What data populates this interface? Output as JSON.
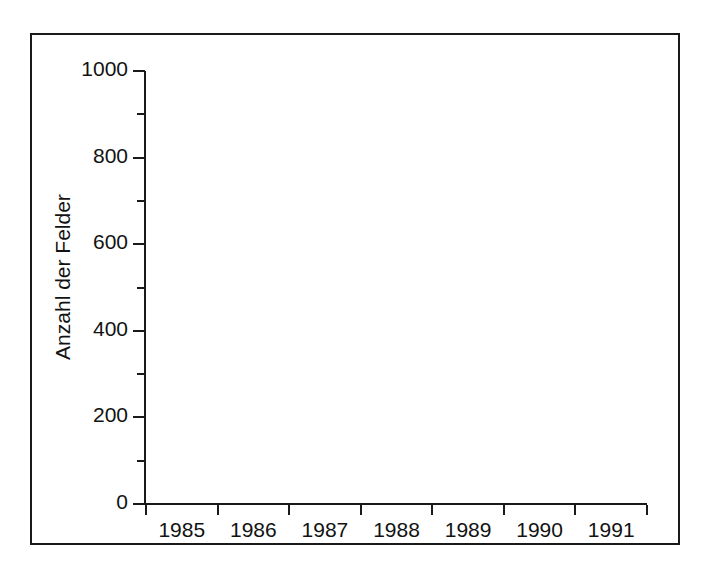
{
  "chart_data": {
    "type": "bar",
    "subtype": "stacked-vertical",
    "title": "",
    "xlabel": "",
    "ylabel": "Anzahl der Felder",
    "categories": [
      "1985",
      "1986",
      "1987",
      "1988",
      "1989",
      "1990",
      "1991"
    ],
    "ylim": [
      0,
      1000
    ],
    "y_ticks_major": [
      0,
      200,
      400,
      600,
      800,
      1000
    ],
    "y_tick_labels": [
      "0",
      "200",
      "400",
      "600",
      "800",
      "1000"
    ],
    "y_ticks_minor": [
      100,
      300,
      500,
      700,
      900
    ],
    "grid": false,
    "legend": false,
    "series": [
      {
        "name": "segment-bottom-black",
        "color": "#0b0b0b",
        "values": [
          0,
          145,
          52,
          49,
          49,
          45,
          25
        ]
      },
      {
        "name": "segment-middle-gray",
        "color": "#a8a8a8",
        "values": [
          575,
          430,
          423,
          385,
          394,
          385,
          310
        ]
      },
      {
        "name": "segment-top-white",
        "color": "#f4f4f4",
        "values": [
          0,
          105,
          242,
          318,
          372,
          430,
          550
        ]
      }
    ],
    "cumulative_tops": {
      "black": [
        0,
        145,
        52,
        49,
        49,
        45,
        25
      ],
      "gray": [
        575,
        575,
        475,
        434,
        443,
        430,
        335
      ],
      "total": [
        575,
        680,
        717,
        752,
        815,
        860,
        885
      ]
    }
  },
  "colors": {
    "axis": "#1a1a1a",
    "frame": "#1a1a1a",
    "black_segment": "#0b0b0b",
    "gray_segment": "#a8a8a8",
    "white_segment": "#f4f4f4",
    "background": "#ffffff",
    "text": "#121212"
  }
}
